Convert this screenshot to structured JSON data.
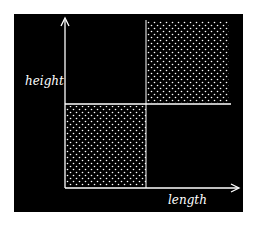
{
  "diagram": {
    "background": "#000000",
    "foreground": "#ffffff",
    "axes": {
      "x_label": "length",
      "y_label": "height"
    },
    "regions": [
      {
        "name": "lower-left",
        "filled": true,
        "pattern": "dots"
      },
      {
        "name": "upper-right",
        "filled": true,
        "pattern": "dots"
      },
      {
        "name": "upper-left",
        "filled": false
      },
      {
        "name": "lower-right",
        "filled": false
      }
    ]
  }
}
